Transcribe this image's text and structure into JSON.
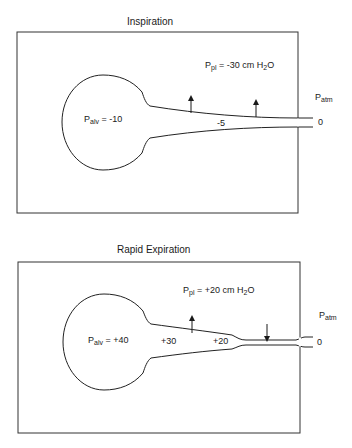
{
  "panels": [
    {
      "title": "Inspiration",
      "pleural_pressure": {
        "symbol": "P",
        "sub": "pl",
        "text": " = -30 cm H",
        "sub2": "2",
        "unit_tail": "O"
      },
      "alveolar_pressure": {
        "symbol": "P",
        "sub": "alv",
        "text": " = -10"
      },
      "airway_pressures": [
        "-5"
      ],
      "atmospheric": {
        "symbol": "P",
        "sub": "atm",
        "value": "0"
      },
      "arrows": [
        {
          "direction": "up",
          "meaning": "airway-distending"
        },
        {
          "direction": "up",
          "meaning": "airway-distending"
        }
      ]
    },
    {
      "title": "Rapid Expiration",
      "pleural_pressure": {
        "symbol": "P",
        "sub": "pl",
        "text": " = +20 cm H",
        "sub2": "2",
        "unit_tail": "O"
      },
      "alveolar_pressure": {
        "symbol": "P",
        "sub": "alv",
        "text": " = +40"
      },
      "airway_pressures": [
        "+30",
        "+20"
      ],
      "atmospheric": {
        "symbol": "P",
        "sub": "atm",
        "value": "0"
      },
      "arrows": [
        {
          "direction": "up",
          "meaning": "airway-distending"
        },
        {
          "direction": "down",
          "meaning": "airway-compressing"
        }
      ]
    }
  ]
}
